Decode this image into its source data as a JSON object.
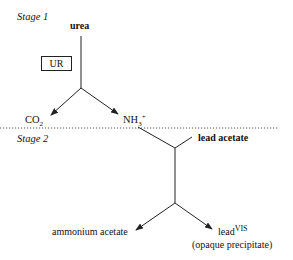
{
  "diagram": {
    "stage1": {
      "label": "Stage 1",
      "reactant": "urea",
      "enzyme": "UR",
      "products": {
        "left": {
          "base": "CO",
          "sub": "2"
        },
        "right": {
          "base": "NH",
          "sub": "3",
          "sup": "+"
        }
      }
    },
    "stage2": {
      "label": "Stage 2",
      "reagent": "lead acetate",
      "products": {
        "left": "ammonium acetate",
        "right": {
          "base": "lead",
          "sup": "VIS",
          "note": "(opaque precipitate)"
        }
      }
    },
    "colors": {
      "line": "#222222",
      "divider": "#555555",
      "background": "#ffffff"
    }
  }
}
